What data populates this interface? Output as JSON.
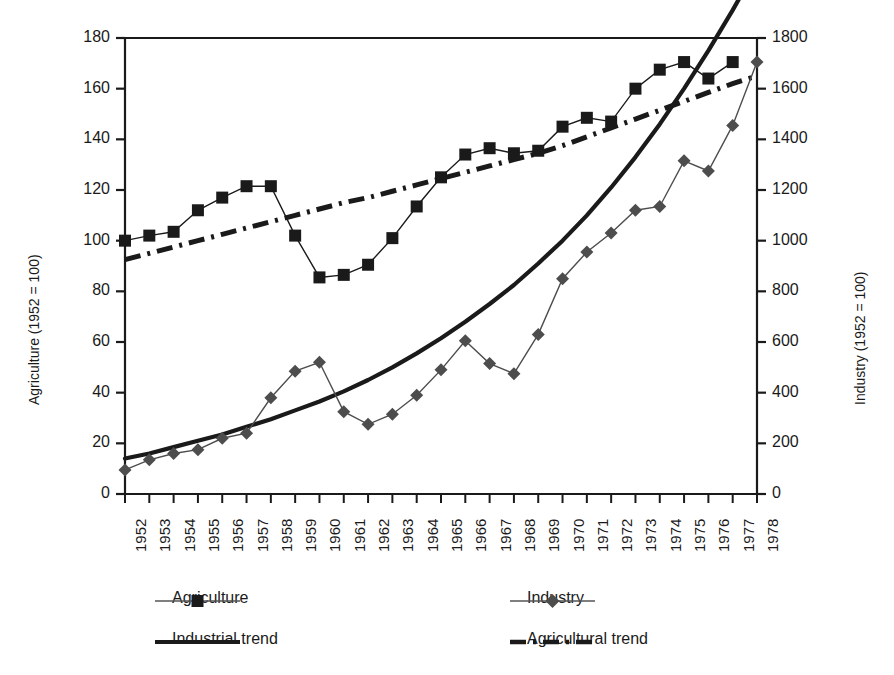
{
  "chart_data": {
    "type": "line",
    "title": "",
    "xlabel": "",
    "ylabel": "Agriculture (1952 = 100)",
    "y2label": "Industry (1952 = 100)",
    "ylim": [
      0,
      180
    ],
    "y2lim": [
      0,
      1800
    ],
    "yticks": [
      0,
      20,
      40,
      60,
      80,
      100,
      120,
      140,
      160,
      180
    ],
    "y2ticks": [
      0,
      200,
      400,
      600,
      800,
      1000,
      1200,
      1400,
      1600,
      1800
    ],
    "grid": false,
    "legend_position": "below-plot",
    "categories": [
      "1952",
      "1953",
      "1954",
      "1955",
      "1956",
      "1957",
      "1958",
      "1959",
      "1960",
      "1961",
      "1962",
      "1963",
      "1964",
      "1965",
      "1966",
      "1967",
      "1968",
      "1969",
      "1970",
      "1971",
      "1972",
      "1973",
      "1974",
      "1975",
      "1976",
      "1977",
      "1978"
    ],
    "series": [
      {
        "name": "Agriculture",
        "axis": "left",
        "marker": "square",
        "color": "#1a1a1a",
        "values": [
          100,
          102,
          103.5,
          112,
          117,
          121.5,
          121.5,
          102,
          85.5,
          86.5,
          90.5,
          101,
          113.5,
          125,
          134,
          136.5,
          134.5,
          135.5,
          145,
          148.5,
          147,
          160,
          167.5,
          170.5,
          164,
          170.5,
          null
        ]
      },
      {
        "name": "Industry",
        "axis": "left-scaled",
        "marker": "diamond",
        "color": "#4d4d4d",
        "values": [
          9.5,
          13.5,
          16,
          17.5,
          22,
          24,
          38,
          48.5,
          52,
          32.5,
          27.5,
          31.5,
          39,
          49,
          60.5,
          51.5,
          47.5,
          63,
          85,
          95.5,
          103,
          112,
          113.5,
          131.5,
          127.5,
          145.5,
          170.5
        ]
      },
      {
        "name": "Industrial trend",
        "axis": "left-scaled",
        "marker": "none",
        "style": "solid",
        "color": "#1a1a1a",
        "values": [
          14,
          16,
          18.5,
          21,
          23.5,
          26.5,
          29.5,
          33,
          36.5,
          40.5,
          45,
          50,
          55.5,
          61.5,
          68,
          75,
          82.5,
          91,
          100,
          110,
          121,
          133,
          146,
          160,
          175,
          191,
          208
        ]
      },
      {
        "name": "Agricultural trend",
        "axis": "left",
        "marker": "none",
        "style": "dash-dot",
        "color": "#1a1a1a",
        "values": [
          92.5,
          95,
          97.5,
          100,
          102.5,
          105,
          107.5,
          110,
          112.5,
          115,
          117,
          119.5,
          122,
          124.5,
          127,
          129.5,
          132,
          134.5,
          137.5,
          141,
          144.5,
          148,
          151.5,
          155,
          158.5,
          162,
          165
        ]
      }
    ]
  },
  "axes": {
    "left_title": "Agriculture (1952 = 100)",
    "right_title": "Industry (1952 = 100)",
    "left_ticks": [
      "0",
      "20",
      "40",
      "60",
      "80",
      "100",
      "120",
      "140",
      "160",
      "180"
    ],
    "right_ticks": [
      "0",
      "200",
      "400",
      "600",
      "800",
      "1000",
      "1200",
      "1400",
      "1600",
      "1800"
    ],
    "x_ticks": [
      "1952",
      "1953",
      "1954",
      "1955",
      "1956",
      "1957",
      "1958",
      "1959",
      "1960",
      "1961",
      "1962",
      "1963",
      "1964",
      "1965",
      "1966",
      "1967",
      "1968",
      "1969",
      "1970",
      "1971",
      "1972",
      "1973",
      "1974",
      "1975",
      "1976",
      "1977",
      "1978"
    ]
  },
  "legend": {
    "items": [
      {
        "label": "Agriculture",
        "marker": "square",
        "line": "thin-solid"
      },
      {
        "label": "Industry",
        "marker": "diamond",
        "line": "thin-solid"
      },
      {
        "label": "Industrial trend",
        "marker": "none",
        "line": "thick-solid"
      },
      {
        "label": "Agricultural trend",
        "marker": "none",
        "line": "dash-dot"
      }
    ]
  },
  "colors": {
    "axis": "#1a1a1a",
    "agriculture": "#1a1a1a",
    "industry": "#4d4d4d",
    "background": "#ffffff"
  }
}
